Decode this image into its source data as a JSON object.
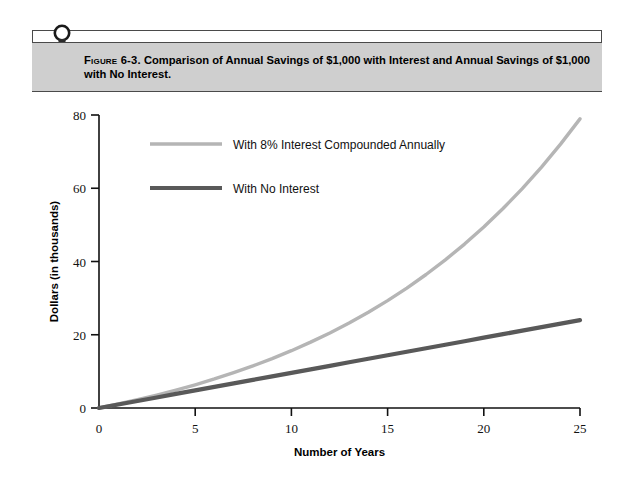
{
  "figure": {
    "icon_name": "bookmark-lamp-icon",
    "label": "Figure 6-3.",
    "caption": "Comparison of Annual Savings of $1,000 with Interest and Annual Savings of $1,000 with No Interest."
  },
  "colors": {
    "frame": "#4a4a4a",
    "title_bar_bg": "#cfcfcf",
    "axis": "#111111",
    "series_interest": "#b5b5b5",
    "series_no_interest": "#595959",
    "page_bg": "#ffffff"
  },
  "chart_data": {
    "type": "line",
    "title": "",
    "xlabel": "Number of Years",
    "ylabel": "Dollars (in thousands)",
    "xlim": [
      0,
      25
    ],
    "ylim": [
      0,
      80
    ],
    "xticks": [
      0,
      5,
      10,
      15,
      20,
      25
    ],
    "yticks": [
      0,
      20,
      40,
      60,
      80
    ],
    "xtick_labels": [
      "0",
      "5",
      "10",
      "15",
      "20",
      "25"
    ],
    "ytick_labels": [
      "0",
      "20",
      "40",
      "60",
      "80"
    ],
    "grid": false,
    "legend_position": "upper-left-inside",
    "x": [
      0,
      1,
      2,
      3,
      4,
      5,
      6,
      7,
      8,
      9,
      10,
      11,
      12,
      13,
      14,
      15,
      16,
      17,
      18,
      19,
      20,
      21,
      22,
      23,
      24,
      25
    ],
    "series": [
      {
        "name": "With 8% Interest Compounded Annually",
        "color": "#b5b5b5",
        "width": 3.4,
        "values": [
          0,
          1.08,
          2.25,
          3.51,
          4.87,
          6.34,
          7.92,
          9.64,
          11.49,
          13.49,
          15.65,
          17.98,
          20.5,
          23.21,
          26.15,
          29.32,
          32.75,
          36.45,
          40.45,
          44.76,
          49.42,
          54.46,
          59.89,
          65.76,
          72.11,
          78.95
        ]
      },
      {
        "name": "With No Interest",
        "color": "#595959",
        "width": 4.2,
        "values": [
          0,
          0.96,
          1.92,
          2.88,
          3.84,
          4.8,
          5.76,
          6.72,
          7.68,
          8.64,
          9.6,
          10.56,
          11.52,
          12.48,
          13.44,
          14.4,
          15.36,
          16.32,
          17.28,
          18.24,
          19.2,
          20.16,
          21.12,
          22.08,
          23.04,
          24.0
        ]
      }
    ],
    "legend": [
      {
        "label": "With 8% Interest Compounded Annually",
        "color": "#b5b5b5",
        "width": 3.4
      },
      {
        "label": "With No Interest",
        "color": "#595959",
        "width": 4.2
      }
    ]
  }
}
